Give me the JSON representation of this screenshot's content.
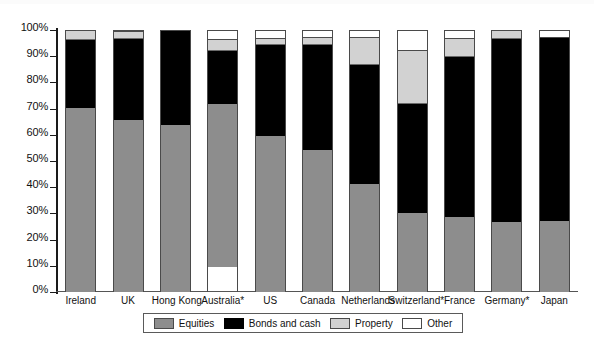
{
  "chart_data": {
    "type": "bar",
    "subtype": "stacked-percentage",
    "title": "",
    "subtitle": "",
    "xlabel": "",
    "ylabel": "",
    "ylim": [
      0,
      100
    ],
    "yunit": "%",
    "grid": false,
    "legend_position": "bottom",
    "ytick_labels": [
      "100%",
      "90%",
      "80%",
      "70%",
      "60%",
      "50%",
      "40%",
      "30%",
      "20%",
      "10%",
      "0%"
    ],
    "ytick_values": [
      100,
      90,
      80,
      70,
      60,
      50,
      40,
      30,
      20,
      10,
      0
    ],
    "categories": [
      "Ireland",
      "UK",
      "Hong Kong",
      "Australia*",
      "US",
      "Canada",
      "Netherlands",
      "Switzerland*",
      "France",
      "Germany*",
      "Japan"
    ],
    "series": [
      {
        "name": "Equities",
        "color": "#8d8d8d",
        "values": [
          70.5,
          66,
          64,
          62,
          60,
          54.5,
          41.5,
          30.5,
          29,
          27,
          27.5
        ]
      },
      {
        "name": "Bonds and cash",
        "color": "#000000",
        "values": [
          26,
          31,
          36,
          20.5,
          34.5,
          40,
          45.5,
          41.5,
          61,
          70,
          70
        ]
      },
      {
        "name": "Property",
        "color": "#d2d2d2",
        "values": [
          3.5,
          2.5,
          0,
          4,
          2.5,
          3,
          10.5,
          20.5,
          7,
          3,
          0
        ]
      },
      {
        "name": "Other",
        "color": "#ffffff",
        "values": [
          0,
          0.5,
          0,
          3.5,
          3,
          2.5,
          2.5,
          7.5,
          3,
          0,
          2.5
        ]
      }
    ]
  },
  "legend": {
    "items": [
      {
        "label": "Equities",
        "icon": "swatch-gray-icon",
        "color": "#8d8d8d"
      },
      {
        "label": "Bonds and cash",
        "icon": "swatch-black-icon",
        "color": "#000000"
      },
      {
        "label": "Property",
        "icon": "swatch-lightgray-icon",
        "color": "#d2d2d2"
      },
      {
        "label": "Other",
        "icon": "swatch-white-icon",
        "color": "#ffffff"
      }
    ]
  },
  "footer": {
    "caption": ""
  }
}
